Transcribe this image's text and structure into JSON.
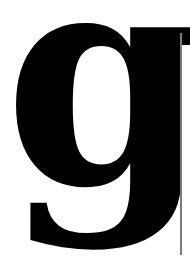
{
  "glyph": {
    "character": "g",
    "color": "#000000"
  },
  "rule": {
    "color": "#7a7a7a"
  }
}
